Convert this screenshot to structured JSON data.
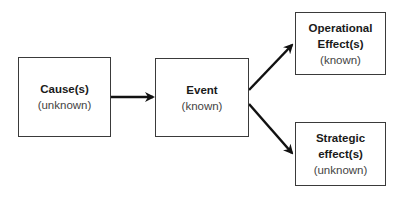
{
  "diagram": {
    "nodes": {
      "cause": {
        "title": "Cause(s)",
        "status": "(unknown)"
      },
      "event": {
        "title": "Event",
        "status": "(known)"
      },
      "operational": {
        "title_line1": "Operational",
        "title_line2": "Effect(s)",
        "status": "(known)"
      },
      "strategic": {
        "title_line1": "Strategic",
        "title_line2": "effect(s)",
        "status": "(unknown)"
      }
    },
    "edges": [
      {
        "from": "cause",
        "to": "event"
      },
      {
        "from": "event",
        "to": "operational"
      },
      {
        "from": "event",
        "to": "strategic"
      }
    ],
    "colors": {
      "border": "#3a3a3a",
      "arrow": "#111111",
      "title_text": "#1a1a1a",
      "status_text": "#444444"
    }
  }
}
